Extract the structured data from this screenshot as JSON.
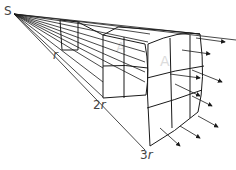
{
  "diagram": {
    "source_label": "S",
    "distance_labels": [
      {
        "num": "",
        "var": "r"
      },
      {
        "num": "2",
        "var": "r"
      },
      {
        "num": "3",
        "var": "r"
      }
    ],
    "area_label": "A",
    "colors": {
      "line": "#1a1a1a",
      "label": "#444444",
      "area_label": "#d8d8d8"
    },
    "grids": [
      "1x1",
      "2x2",
      "3x3"
    ]
  }
}
